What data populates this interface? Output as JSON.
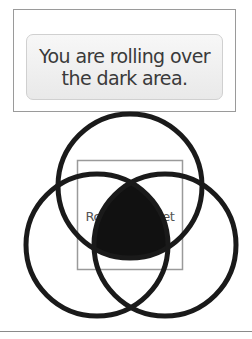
{
  "message": {
    "line1": "You are rolling over",
    "line2": "the dark area."
  },
  "diagram": {
    "target_label": "Rollover target",
    "circles": [
      {
        "name": "top",
        "cx": 130,
        "cy": 186,
        "r": 72
      },
      {
        "name": "left",
        "cx": 97,
        "cy": 245,
        "r": 71
      },
      {
        "name": "right",
        "cx": 165,
        "cy": 245,
        "r": 71
      }
    ],
    "target_rect": {
      "x": 77,
      "y": 160,
      "width": 105,
      "height": 109
    },
    "colors": {
      "circle_stroke": "#1a1a1a",
      "dark_area": "#111111",
      "rect_stroke": "#9a9a9a"
    }
  }
}
